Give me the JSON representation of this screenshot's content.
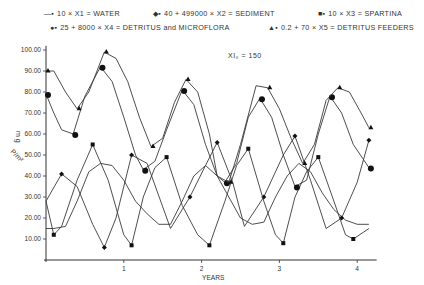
{
  "legend": {
    "items": [
      {
        "symbol": "line-square",
        "label": "10 × X1 = WATER"
      },
      {
        "symbol": "diamond",
        "label": "40 + 499000 × X2 = SEDIMENT"
      },
      {
        "symbol": "square",
        "label": "10 × X3 = SPARTINA"
      },
      {
        "symbol": "dot",
        "label": "25 + 8000 × X4 = DETRITUS and MICROFLORA"
      },
      {
        "symbol": "triangle",
        "label": "0.2 + 70 × X5 = DETRITUS FEEDERS"
      }
    ]
  },
  "annotation": "XI₀ = 150",
  "chart_data": {
    "type": "line",
    "title": "",
    "xlabel": "YEARS",
    "ylabel": "mg P/m²",
    "xlim": [
      0,
      4.2
    ],
    "ylim": [
      0,
      100
    ],
    "xticks": [
      "1",
      "2",
      "3",
      "4"
    ],
    "yticks": [
      "10.00",
      "20.00",
      "30.00",
      "40.00",
      "50.00",
      "60.00",
      "70.00",
      "80.00",
      "90.00",
      "100.00"
    ],
    "grid": false,
    "legend_position": "top",
    "series": [
      {
        "name": "10 × X1 = WATER",
        "marker": "none",
        "x": [
          0,
          0.1,
          0.25,
          0.4,
          0.55,
          0.7,
          0.85,
          1.0,
          1.15,
          1.3,
          1.45,
          1.6,
          1.75,
          1.9,
          2.05,
          2.2,
          2.35,
          2.5,
          2.65,
          2.8,
          2.95,
          3.1,
          3.25,
          3.4,
          3.55,
          3.7,
          3.85,
          4.0,
          4.15
        ],
        "y": [
          15,
          15,
          16,
          28,
          42,
          46,
          45,
          38,
          28,
          22,
          17,
          17,
          28,
          40,
          45,
          40,
          30,
          20,
          17,
          18,
          30,
          40,
          46,
          42,
          32,
          24,
          19,
          17,
          17
        ]
      },
      {
        "name": "40 + 499000 × X2 = SEDIMENT",
        "marker": "diamond",
        "x": [
          0,
          0.2,
          0.4,
          0.6,
          0.75,
          0.9,
          1.1,
          1.3,
          1.6,
          1.85,
          2.05,
          2.2,
          2.4,
          2.55,
          2.8,
          3.05,
          3.2,
          3.4,
          3.6,
          3.8,
          4.0,
          4.15
        ],
        "y": [
          28,
          41,
          35,
          17,
          6,
          20,
          50,
          46,
          15,
          30,
          45,
          56,
          37,
          16,
          30,
          50,
          59,
          38,
          15,
          20,
          37,
          57
        ]
      },
      {
        "name": "10 × X3 = SPARTINA",
        "marker": "square",
        "x": [
          0,
          0.1,
          0.2,
          0.4,
          0.6,
          0.8,
          1.0,
          1.1,
          1.25,
          1.4,
          1.55,
          1.75,
          1.95,
          2.1,
          2.3,
          2.45,
          2.6,
          2.8,
          2.95,
          3.05,
          3.2,
          3.35,
          3.5,
          3.7,
          3.85,
          3.95,
          4.15
        ],
        "y": [
          28,
          12,
          16,
          38,
          55,
          38,
          12,
          7,
          30,
          44,
          49,
          26,
          12,
          7,
          28,
          45,
          53,
          28,
          12,
          8,
          30,
          42,
          49,
          28,
          12,
          10,
          15
        ]
      },
      {
        "name": "25 + 8000 × X4 = DETRITUS and MICROFLORA",
        "marker": "dot",
        "x": [
          0,
          0.1,
          0.2,
          0.35,
          0.5,
          0.7,
          0.85,
          1.0,
          1.15,
          1.25,
          1.4,
          1.55,
          1.75,
          1.9,
          2.05,
          2.2,
          2.3,
          2.45,
          2.6,
          2.75,
          2.9,
          3.05,
          3.2,
          3.35,
          3.5,
          3.65,
          3.8,
          3.95,
          4.15
        ],
        "y": [
          79,
          70,
          62,
          60,
          78,
          92,
          85,
          68,
          50,
          43,
          47,
          62,
          81,
          74,
          55,
          40,
          37,
          46,
          68,
          77,
          68,
          50,
          35,
          38,
          60,
          78,
          70,
          55,
          44
        ]
      },
      {
        "name": "0.2 + 70 × X5 = DETRITUS FEEDERS",
        "marker": "triangle",
        "x": [
          0,
          0.1,
          0.25,
          0.4,
          0.55,
          0.75,
          0.9,
          1.05,
          1.2,
          1.35,
          1.5,
          1.65,
          1.8,
          1.95,
          2.1,
          2.2,
          2.35,
          2.5,
          2.7,
          2.85,
          3.0,
          3.15,
          3.3,
          3.45,
          3.6,
          3.75,
          3.9,
          4.05,
          4.15
        ],
        "y": [
          90,
          90,
          80,
          72,
          80,
          99,
          96,
          85,
          68,
          54,
          58,
          75,
          86,
          80,
          60,
          40,
          37,
          55,
          83,
          82,
          72,
          58,
          46,
          55,
          76,
          82,
          80,
          70,
          63
        ]
      }
    ]
  },
  "axes": {
    "xlabel": "YEARS",
    "ylabel_top": "m g",
    "ylabel_bottom": "P/m²"
  }
}
